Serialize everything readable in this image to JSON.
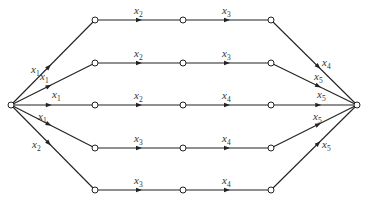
{
  "diagram": {
    "type": "signal-flow-graph",
    "source": {
      "id": "s",
      "x": 11,
      "y": 105
    },
    "sink": {
      "id": "t",
      "x": 357,
      "y": 105
    },
    "columns_x": [
      95,
      183,
      271
    ],
    "paths": [
      {
        "row_y": 20,
        "labels": [
          "x",
          "x",
          "x",
          "x"
        ],
        "subs": [
          "1",
          "2",
          "3",
          "4"
        ]
      },
      {
        "row_y": 63,
        "labels": [
          "x",
          "x",
          "x",
          "x"
        ],
        "subs": [
          "1",
          "2",
          "3",
          "5"
        ]
      },
      {
        "row_y": 105,
        "labels": [
          "x",
          "x",
          "x",
          "x"
        ],
        "subs": [
          "1",
          "2",
          "4",
          "5"
        ]
      },
      {
        "row_y": 148,
        "labels": [
          "x",
          "x",
          "x",
          "x"
        ],
        "subs": [
          "1",
          "3",
          "4",
          "5"
        ]
      },
      {
        "row_y": 190,
        "labels": [
          "x",
          "x",
          "x",
          "x"
        ],
        "subs": [
          "2",
          "3",
          "4",
          "5"
        ]
      }
    ],
    "edge_labels": {
      "in": [
        "x1",
        "x1",
        "x1",
        "x1",
        "x2"
      ],
      "mid1": [
        "x2",
        "x2",
        "x2",
        "x3",
        "x3"
      ],
      "mid2": [
        "x3",
        "x3",
        "x4",
        "x4",
        "x4"
      ],
      "out": [
        "x4",
        "x5",
        "x5",
        "x5",
        "x5"
      ]
    }
  }
}
